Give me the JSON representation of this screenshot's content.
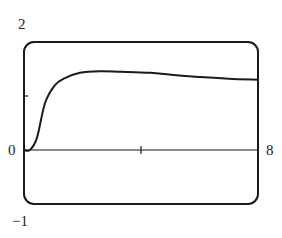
{
  "chart_data": {
    "type": "line",
    "title": "",
    "xlabel": "",
    "ylabel": "",
    "xlim": [
      0,
      8
    ],
    "ylim": [
      -1,
      2
    ],
    "grid": false,
    "legend": null,
    "tick_labels": {
      "y_top": "2",
      "y_zero": "0",
      "y_bottom": "−1",
      "x_right": "8"
    },
    "ticks": {
      "x": [
        4
      ],
      "y": [
        1
      ]
    },
    "series": [
      {
        "name": "curve",
        "x": [
          0,
          0.2,
          0.44,
          0.72,
          1.06,
          1.4,
          1.91,
          2.6,
          3.3,
          4.31,
          5.1,
          6.02,
          7.0,
          8.0
        ],
        "y": [
          0,
          0.0,
          0.22,
          0.87,
          1.2,
          1.33,
          1.43,
          1.46,
          1.45,
          1.43,
          1.39,
          1.35,
          1.32,
          1.3
        ]
      }
    ],
    "colors": {
      "line": "#1a1a1a",
      "frame": "#1a1a1a"
    }
  }
}
